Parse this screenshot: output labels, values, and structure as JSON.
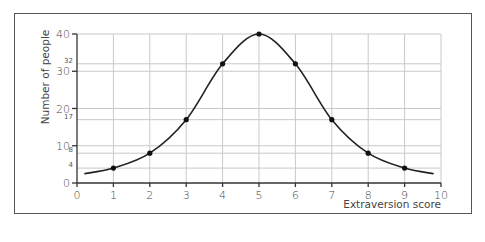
{
  "chart_data": {
    "type": "line",
    "title": "",
    "xlabel": "Extraversion score",
    "ylabel": "Number of people",
    "x": [
      1,
      2,
      3,
      4,
      5,
      6,
      7,
      8,
      9
    ],
    "values": [
      4,
      8,
      17,
      32,
      40,
      32,
      17,
      8,
      4
    ],
    "curve_extent": {
      "x_start": 0.2,
      "y_start": 2.5,
      "x_end": 9.8,
      "y_end": 2.5
    },
    "xlim": [
      0,
      10
    ],
    "ylim": [
      0,
      40
    ],
    "x_ticks": [
      "0",
      "1",
      "2",
      "3",
      "4",
      "5",
      "6",
      "7",
      "8",
      "9",
      "10"
    ],
    "y_ticks": [
      "0",
      "10",
      "20",
      "30",
      "40"
    ],
    "y_minor_value_labels": [
      "4",
      "8",
      "17",
      "32"
    ],
    "grid": true,
    "legend": null,
    "shape": "smooth bell curve with marked data points"
  }
}
